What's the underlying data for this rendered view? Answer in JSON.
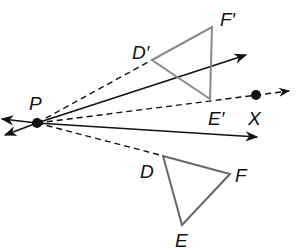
{
  "diagram": {
    "center": {
      "label": "P",
      "x": 37,
      "y": 123
    },
    "point_x": {
      "label": "X",
      "x": 256,
      "y": 95
    },
    "original_triangle": {
      "vertices": [
        {
          "label": "D",
          "x": 163,
          "y": 156
        },
        {
          "label": "E",
          "x": 182,
          "y": 225
        },
        {
          "label": "F",
          "x": 230,
          "y": 174
        }
      ],
      "stroke": "#666666"
    },
    "image_triangle": {
      "vertices": [
        {
          "label": "D′",
          "x": 152,
          "y": 60
        },
        {
          "label": "E′",
          "x": 210,
          "y": 99
        },
        {
          "label": "F′",
          "x": 212,
          "y": 27
        }
      ],
      "stroke": "#8a8a8a"
    },
    "labels": {
      "P": "P",
      "X": "X",
      "D": "D",
      "E": "E",
      "F": "F",
      "D_prime": "D′",
      "E_prime": "E′",
      "F_prime": "F′"
    }
  }
}
